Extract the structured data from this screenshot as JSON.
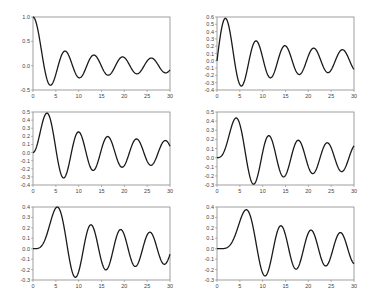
{
  "chart_data": [
    {
      "type": "line",
      "title": "",
      "series": [
        {
          "name": "J0(x)",
          "function": "besselj",
          "order": 0
        }
      ],
      "xlabel": "",
      "ylabel": "",
      "xlim": [
        0,
        30
      ],
      "ylim": [
        -0.5,
        1.0
      ],
      "xticks": [
        0,
        5,
        10,
        15,
        20,
        25,
        30
      ],
      "yticks": [
        -0.5,
        0.0,
        0.5,
        1.0
      ],
      "ytick_labels": [
        "-0.5",
        "0.0",
        "0.5",
        "1.0"
      ],
      "grid": false,
      "legend": false,
      "key_points": {
        "x": [
          0,
          3.83,
          7.02,
          10.17,
          13.32,
          16.47,
          19.62,
          22.76,
          25.9,
          29.05
        ],
        "y": [
          1.0,
          -0.4,
          0.3,
          -0.25,
          0.22,
          -0.2,
          0.18,
          -0.17,
          0.16,
          -0.15
        ]
      }
    },
    {
      "type": "line",
      "title": "",
      "series": [
        {
          "name": "J1(x)",
          "function": "besselj",
          "order": 1
        }
      ],
      "xlabel": "",
      "ylabel": "",
      "xlim": [
        0,
        30
      ],
      "ylim": [
        -0.4,
        0.6
      ],
      "xticks": [
        0,
        5,
        10,
        15,
        20,
        25,
        30
      ],
      "yticks": [
        -0.4,
        -0.3,
        -0.2,
        -0.1,
        0.0,
        0.1,
        0.2,
        0.3,
        0.4,
        0.5,
        0.6
      ],
      "ytick_labels": [
        "-0.4",
        "-0.3",
        "-0.2",
        "-0.1",
        "0.0",
        "0.1",
        "0.2",
        "0.3",
        "0.4",
        "0.5",
        "0.6"
      ],
      "grid": false,
      "legend": false,
      "key_points": {
        "x": [
          0,
          1.84,
          5.33,
          8.54,
          11.71,
          14.86,
          18.02,
          21.16,
          24.31,
          27.46
        ],
        "y": [
          0.0,
          0.58,
          -0.35,
          0.27,
          -0.23,
          0.21,
          -0.19,
          0.17,
          -0.16,
          0.15
        ]
      }
    },
    {
      "type": "line",
      "title": "",
      "series": [
        {
          "name": "J2(x)",
          "function": "besselj",
          "order": 2
        }
      ],
      "xlabel": "",
      "ylabel": "",
      "xlim": [
        0,
        30
      ],
      "ylim": [
        -0.4,
        0.5
      ],
      "xticks": [
        0,
        5,
        10,
        15,
        20,
        25,
        30
      ],
      "yticks": [
        -0.4,
        -0.3,
        -0.2,
        -0.1,
        0.0,
        0.1,
        0.2,
        0.3,
        0.4,
        0.5
      ],
      "ytick_labels": [
        "-0.4",
        "-0.3",
        "-0.2",
        "-0.1",
        "0.0",
        "0.1",
        "0.2",
        "0.3",
        "0.4",
        "0.5"
      ],
      "grid": false,
      "legend": false,
      "key_points": {
        "x": [
          0,
          3.05,
          6.71,
          9.97,
          13.17,
          16.35,
          19.51,
          22.67,
          25.83,
          28.97
        ],
        "y": [
          0.0,
          0.49,
          -0.3,
          0.25,
          -0.22,
          0.2,
          -0.18,
          0.17,
          -0.16,
          0.15
        ]
      }
    },
    {
      "type": "line",
      "title": "",
      "series": [
        {
          "name": "J3(x)",
          "function": "besselj",
          "order": 3
        }
      ],
      "xlabel": "",
      "ylabel": "",
      "xlim": [
        0,
        30
      ],
      "ylim": [
        -0.3,
        0.5
      ],
      "xticks": [
        0,
        5,
        10,
        15,
        20,
        25,
        30
      ],
      "yticks": [
        -0.3,
        -0.2,
        -0.1,
        0.0,
        0.1,
        0.2,
        0.3,
        0.4,
        0.5
      ],
      "ytick_labels": [
        "-0.3",
        "-0.2",
        "-0.1",
        "0.0",
        "0.1",
        "0.2",
        "0.3",
        "0.4",
        "0.5"
      ],
      "grid": false,
      "legend": false,
      "key_points": {
        "x": [
          0,
          4.2,
          8.02,
          11.35,
          14.59,
          17.79,
          20.97,
          24.14,
          27.3
        ],
        "y": [
          0.0,
          0.43,
          -0.29,
          0.24,
          -0.21,
          0.19,
          -0.18,
          0.16,
          -0.15
        ]
      }
    },
    {
      "type": "line",
      "title": "",
      "series": [
        {
          "name": "J4(x)",
          "function": "besselj",
          "order": 4
        }
      ],
      "xlabel": "",
      "ylabel": "",
      "xlim": [
        0,
        30
      ],
      "ylim": [
        -0.3,
        0.4
      ],
      "xticks": [
        0,
        5,
        10,
        15,
        20,
        25,
        30
      ],
      "yticks": [
        -0.3,
        -0.2,
        -0.1,
        0.0,
        0.1,
        0.2,
        0.3,
        0.4
      ],
      "ytick_labels": [
        "-0.3",
        "-0.2",
        "-0.1",
        "0.0",
        "0.1",
        "0.2",
        "0.3",
        "0.4"
      ],
      "grid": false,
      "legend": false,
      "key_points": {
        "x": [
          0,
          5.32,
          9.28,
          12.68,
          15.96,
          19.2,
          22.4,
          25.59,
          28.76
        ],
        "y": [
          0.0,
          0.4,
          -0.27,
          0.23,
          -0.2,
          0.18,
          -0.17,
          0.16,
          -0.15
        ]
      }
    },
    {
      "type": "line",
      "title": "",
      "series": [
        {
          "name": "J5(x)",
          "function": "besselj",
          "order": 5
        }
      ],
      "xlabel": "",
      "ylabel": "",
      "xlim": [
        0,
        30
      ],
      "ylim": [
        -0.3,
        0.4
      ],
      "xticks": [
        0,
        5,
        10,
        15,
        20,
        25,
        30
      ],
      "yticks": [
        -0.3,
        -0.2,
        -0.1,
        0.0,
        0.1,
        0.2,
        0.3,
        0.4
      ],
      "ytick_labels": [
        "-0.3",
        "-0.2",
        "-0.1",
        "0.0",
        "0.1",
        "0.2",
        "0.3",
        "0.4"
      ],
      "grid": false,
      "legend": false,
      "key_points": {
        "x": [
          0,
          6.42,
          10.52,
          13.99,
          17.31,
          20.58,
          23.8,
          27.01
        ],
        "y": [
          0.0,
          0.37,
          -0.26,
          0.22,
          -0.2,
          0.18,
          -0.17,
          0.16
        ]
      }
    }
  ],
  "layout": {
    "panels": [
      {
        "left": 33,
        "top": 17,
        "width": 137,
        "height": 73
      },
      {
        "left": 217,
        "top": 17,
        "width": 137,
        "height": 73
      },
      {
        "left": 33,
        "top": 112,
        "width": 137,
        "height": 73
      },
      {
        "left": 217,
        "top": 112,
        "width": 137,
        "height": 73
      },
      {
        "left": 33,
        "top": 207,
        "width": 137,
        "height": 73
      },
      {
        "left": 217,
        "top": 207,
        "width": 137,
        "height": 73
      }
    ],
    "line_color": "#1a1a1a",
    "axis_color": "#888888",
    "tick_label_color": "#444444"
  }
}
